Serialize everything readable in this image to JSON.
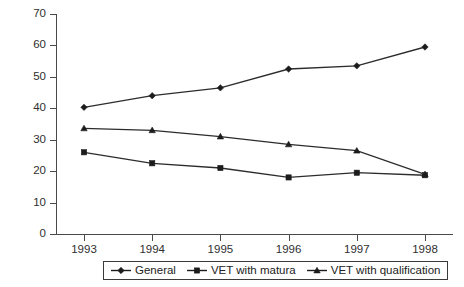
{
  "chart_data": {
    "type": "line",
    "title": "",
    "subtitle": "",
    "xlabel": "",
    "ylabel": "",
    "categories": [
      "1993",
      "1994",
      "1995",
      "1996",
      "1997",
      "1998"
    ],
    "x": [
      1993,
      1994,
      1995,
      1996,
      1997,
      1998
    ],
    "ylim": [
      0,
      70
    ],
    "yticks": [
      0,
      10,
      20,
      30,
      40,
      50,
      60,
      70
    ],
    "ytick_labels": [
      "0",
      "10",
      "20",
      "30",
      "40",
      "50",
      "60",
      "70"
    ],
    "grid": false,
    "legend_position": "bottom",
    "series": [
      {
        "name": "General",
        "marker": "diamond",
        "color": "#1c1c1c",
        "values": [
          40.3,
          44.0,
          46.5,
          52.5,
          53.5,
          59.5
        ]
      },
      {
        "name": "VET with matura",
        "marker": "square",
        "color": "#1c1c1c",
        "values": [
          26.0,
          22.5,
          21.0,
          18.0,
          19.5,
          18.7
        ]
      },
      {
        "name": "VET with qualification",
        "marker": "triangle",
        "color": "#1c1c1c",
        "values": [
          33.6,
          33.0,
          31.0,
          28.5,
          26.5,
          19.0
        ]
      }
    ]
  },
  "legend": {
    "entries": [
      {
        "label": "General",
        "marker": "diamond"
      },
      {
        "label": "VET with matura",
        "marker": "square"
      },
      {
        "label": "VET with qualification",
        "marker": "triangle"
      }
    ]
  }
}
